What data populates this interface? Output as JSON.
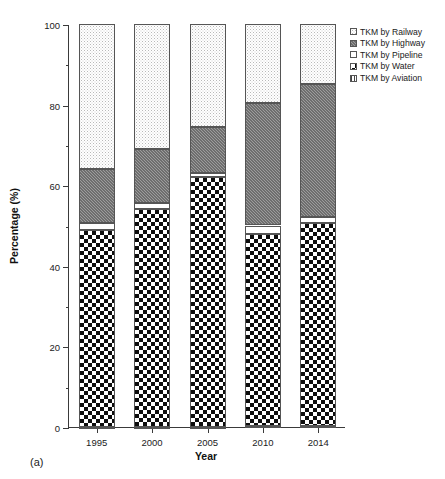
{
  "figure": {
    "caption": "(a)"
  },
  "axes": {
    "ylabel": "Percentage (%)",
    "xlabel": "Year",
    "yticks": [
      "0",
      "20",
      "40",
      "60",
      "80",
      "100"
    ],
    "xticks": [
      "1995",
      "2000",
      "2005",
      "2010",
      "2014"
    ]
  },
  "legend": {
    "items": [
      {
        "label": "TKM by Railway",
        "pattern": "p-railway"
      },
      {
        "label": "TKM by Highway",
        "pattern": "p-highway"
      },
      {
        "label": "TKM by Pipeline",
        "pattern": "p-pipeline"
      },
      {
        "label": "TKM by Water",
        "pattern": "p-water"
      },
      {
        "label": "TKM by Aviation",
        "pattern": "p-aviation"
      }
    ]
  },
  "chart_data": {
    "type": "bar",
    "subtype": "stacked-bar-100-percent",
    "title": "",
    "xlabel": "Year",
    "ylabel": "Percentage (%)",
    "categories": [
      "1995",
      "2000",
      "2005",
      "2010",
      "2014"
    ],
    "ylim": [
      0,
      100
    ],
    "ytick_step": 20,
    "yminor_step": 10,
    "grid": false,
    "legend_position": "top-right-outside",
    "stack_order_bottom_to_top": [
      "TKM by Aviation",
      "TKM by Water",
      "TKM by Pipeline",
      "TKM by Highway",
      "TKM by Railway"
    ],
    "series": [
      {
        "name": "TKM by Aviation",
        "pattern": "p-aviation",
        "values": [
          0.1,
          0.1,
          0.1,
          0.2,
          0.2
        ]
      },
      {
        "name": "TKM by Water",
        "pattern": "p-water",
        "values": [
          48.9,
          53.9,
          61.9,
          47.8,
          50.3
        ]
      },
      {
        "name": "TKM by Pipeline",
        "pattern": "p-pipeline",
        "values": [
          1.5,
          1.5,
          1.0,
          2.0,
          1.5
        ]
      },
      {
        "name": "TKM by Highway",
        "pattern": "p-highway",
        "values": [
          13.5,
          13.5,
          11.5,
          30.5,
          33.0
        ]
      },
      {
        "name": "TKM by Railway",
        "pattern": "p-railway",
        "values": [
          36.0,
          31.0,
          25.5,
          19.5,
          15.0
        ]
      }
    ],
    "cumulative_tops": {
      "1995": {
        "aviation": 0.1,
        "water": 49.0,
        "pipeline": 50.5,
        "highway": 64.0,
        "railway": 100
      },
      "2000": {
        "aviation": 0.1,
        "water": 54.0,
        "pipeline": 55.5,
        "highway": 69.0,
        "railway": 100
      },
      "2005": {
        "aviation": 0.1,
        "water": 62.0,
        "pipeline": 63.0,
        "highway": 74.5,
        "railway": 100
      },
      "2010": {
        "aviation": 0.2,
        "water": 48.0,
        "pipeline": 50.0,
        "highway": 80.5,
        "railway": 100
      },
      "2014": {
        "aviation": 0.2,
        "water": 50.5,
        "pipeline": 52.0,
        "highway": 85.0,
        "railway": 100
      }
    }
  }
}
